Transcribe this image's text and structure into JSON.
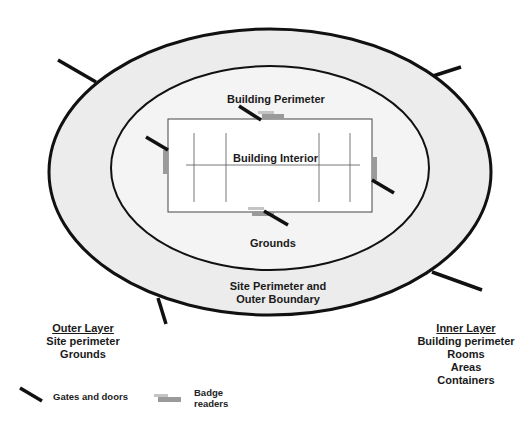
{
  "diagram": {
    "zones": {
      "building_perimeter": "Building Perimeter",
      "building_interior": "Building Interior",
      "grounds": "Grounds",
      "site_perimeter_line1": "Site Perimeter and",
      "site_perimeter_line2": "Outer Boundary"
    },
    "outer_layer": {
      "heading": "Outer Layer",
      "items": [
        "Site perimeter",
        "Grounds"
      ]
    },
    "inner_layer": {
      "heading": "Inner Layer",
      "items": [
        "Building perimeter",
        "Rooms",
        "Areas",
        "Containers"
      ]
    },
    "legend": {
      "gates_label": "Gates and doors",
      "badge_label_line1": "Badge",
      "badge_label_line2": "readers",
      "gates_icon": "gate-door-line-icon",
      "badge_icon": "badge-reader-icon"
    },
    "colors": {
      "ring_fill": "#ececec",
      "inner_fill": "#f4f4f4",
      "building_fill": "#ffffff",
      "stroke": "#111111",
      "badge_reader": "#9a9a9a",
      "badge_reader_light": "#c4c4c4"
    }
  }
}
